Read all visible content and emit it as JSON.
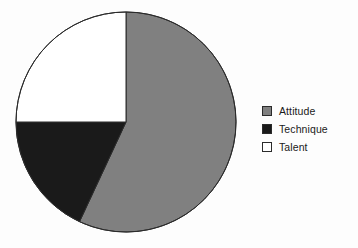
{
  "chart_data": {
    "type": "pie",
    "title": "",
    "subtitle": "",
    "xlabel": "",
    "ylabel": "",
    "legend_position": "right",
    "grid": false,
    "start_angle_deg": 0,
    "direction": "clockwise",
    "center": {
      "cx": 126,
      "cy": 122,
      "r": 110
    },
    "categories": [
      "Attitude",
      "Technique",
      "Talent"
    ],
    "values": [
      57,
      18,
      25
    ],
    "percentages": [
      "57%",
      "18%",
      "25%"
    ],
    "angles_deg": [
      205,
      65,
      90
    ],
    "colors": [
      "#808080",
      "#1a1a1a",
      "#ffffff"
    ],
    "slice_border_color": "#2b2b2b",
    "slices": [
      {
        "label": "Attitude",
        "value": 57,
        "percent": "57%",
        "angle_deg": 205,
        "color": "#808080",
        "swatch_color": "#808080"
      },
      {
        "label": "Technique",
        "value": 18,
        "percent": "18%",
        "angle_deg": 65,
        "color": "#1a1a1a",
        "swatch_color": "#1a1a1a"
      },
      {
        "label": "Talent",
        "value": 25,
        "percent": "25%",
        "angle_deg": 90,
        "color": "#ffffff",
        "swatch_color": "#ffffff"
      }
    ]
  },
  "legend": {
    "items": [
      {
        "label": "Attitude",
        "color": "#808080"
      },
      {
        "label": "Technique",
        "color": "#1a1a1a"
      },
      {
        "label": "Talent",
        "color": "#ffffff"
      }
    ]
  },
  "canvas": {
    "background": "#fdfdfd",
    "width": 358,
    "height": 248
  }
}
